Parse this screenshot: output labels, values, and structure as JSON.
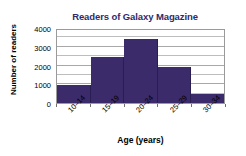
{
  "chart_data": {
    "type": "bar",
    "title": "Readers of Galaxy Magazine",
    "xlabel": "Age (years)",
    "ylabel": "Number of readers",
    "categories": [
      "10–14",
      "15–19",
      "20–24",
      "25–29",
      "30–34"
    ],
    "values": [
      1000,
      2500,
      3500,
      1950,
      500
    ],
    "ylim": [
      0,
      4000
    ],
    "ytick_labels": [
      "0",
      "1000",
      "2000",
      "3000",
      "4000"
    ],
    "ytick_values": [
      0,
      1000,
      2000,
      3000,
      4000
    ],
    "minor_gridline_values": [
      500,
      1500,
      2500,
      3500
    ],
    "grid": "horizontal",
    "legend": "none",
    "bar_color": "#3b2b6b",
    "title_color": "#2d2b6b",
    "axis_label_color": "#000000",
    "gridline_color": "#bdbdbd",
    "plot_border_color": "#9a9a9a",
    "background_color": "#ffffff"
  }
}
